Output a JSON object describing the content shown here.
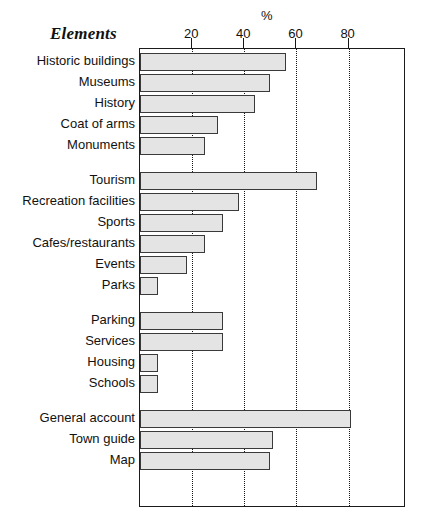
{
  "chart_data": {
    "type": "bar",
    "orientation": "horizontal",
    "title": "Elements",
    "xlabel": "%",
    "ylabel": "",
    "xlim": [
      0,
      102
    ],
    "grid": true,
    "legend": false,
    "ticks": [
      20,
      40,
      60,
      80
    ],
    "categories": [
      "Historic buildings",
      "Museums",
      "History",
      "Coat of arms",
      "Monuments",
      "Tourism",
      "Recreation facilities",
      "Sports",
      "Cafes/restaurants",
      "Events",
      "Parks",
      "Parking",
      "Services",
      "Housing",
      "Schools",
      "General account",
      "Town guide",
      "Map"
    ],
    "values": [
      56,
      50,
      44,
      30,
      25,
      68,
      38,
      32,
      25,
      18,
      7,
      32,
      32,
      7,
      7,
      81,
      51,
      50
    ],
    "groups": [
      {
        "items": [
          {
            "label": "Historic buildings",
            "value": 56
          },
          {
            "label": "Museums",
            "value": 50
          },
          {
            "label": "History",
            "value": 44
          },
          {
            "label": "Coat of arms",
            "value": 30
          },
          {
            "label": "Monuments",
            "value": 25
          }
        ]
      },
      {
        "items": [
          {
            "label": "Tourism",
            "value": 68
          },
          {
            "label": "Recreation facilities",
            "value": 38
          },
          {
            "label": "Sports",
            "value": 32
          },
          {
            "label": "Cafes/restaurants",
            "value": 25
          },
          {
            "label": "Events",
            "value": 18
          },
          {
            "label": "Parks",
            "value": 7
          }
        ]
      },
      {
        "items": [
          {
            "label": "Parking",
            "value": 32
          },
          {
            "label": "Services",
            "value": 32
          },
          {
            "label": "Housing",
            "value": 7
          },
          {
            "label": "Schools",
            "value": 7
          }
        ]
      },
      {
        "items": [
          {
            "label": "General account",
            "value": 81
          },
          {
            "label": "Town guide",
            "value": 51
          },
          {
            "label": "Map",
            "value": 50
          }
        ]
      }
    ],
    "colors": {
      "bar_fill": "#e4e4e4",
      "bar_stroke": "#3a3a3a",
      "axis": "#1b1b1b",
      "grid": "#161616",
      "text": "#111111"
    }
  }
}
